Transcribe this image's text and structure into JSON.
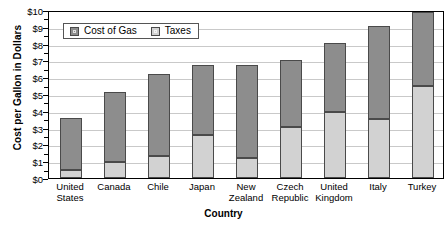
{
  "chart_data": {
    "type": "bar",
    "subtype": "stacked-bar",
    "title": "",
    "xlabel": "Country",
    "ylabel": "Cost per Gallon in Dollars",
    "categories": [
      "United States",
      "Canada",
      "Chile",
      "Japan",
      "New Zealand",
      "Czech Republic",
      "United Kingdom",
      "Italy",
      "Turkey"
    ],
    "category_lines": [
      [
        "United",
        "States"
      ],
      [
        "Canada",
        ""
      ],
      [
        "Chile",
        ""
      ],
      [
        "Japan",
        ""
      ],
      [
        "New",
        "Zealand"
      ],
      [
        "Czech",
        "Republic"
      ],
      [
        "United",
        "Kingdom"
      ],
      [
        "Italy",
        ""
      ],
      [
        "Turkey",
        ""
      ]
    ],
    "series": [
      {
        "name": "Taxes",
        "color": "#d2d2d2",
        "values": [
          0.45,
          0.95,
          1.3,
          2.55,
          1.2,
          3.05,
          3.95,
          3.5,
          5.5
        ]
      },
      {
        "name": "Cost of Gas",
        "color": "#8d8d8d",
        "values": [
          3.15,
          4.15,
          4.9,
          4.15,
          5.55,
          3.95,
          4.1,
          5.55,
          4.4
        ]
      }
    ],
    "totals": [
      3.6,
      5.1,
      6.2,
      6.7,
      6.75,
      7.0,
      8.05,
      9.05,
      9.9
    ],
    "ylim": [
      0,
      10
    ],
    "ytick_values": [
      0,
      1,
      2,
      3,
      4,
      5,
      6,
      7,
      8,
      9,
      10
    ],
    "ytick_labels": [
      "$0",
      "$1",
      "$2",
      "$3",
      "$4",
      "$5",
      "$6",
      "$7",
      "$8",
      "$9",
      "$10"
    ],
    "grid": "horizontal",
    "legend_position": "top-left-inside",
    "legend_entries": [
      "Cost of Gas",
      "Taxes"
    ],
    "stack_order_bottom_to_top": [
      "Taxes",
      "Cost of Gas"
    ]
  },
  "legend": {
    "gas_label": "Cost of Gas",
    "taxes_label": "Taxes"
  },
  "axes": {
    "y_title": "Cost per Gallon in Dollars",
    "x_title": "Country"
  }
}
